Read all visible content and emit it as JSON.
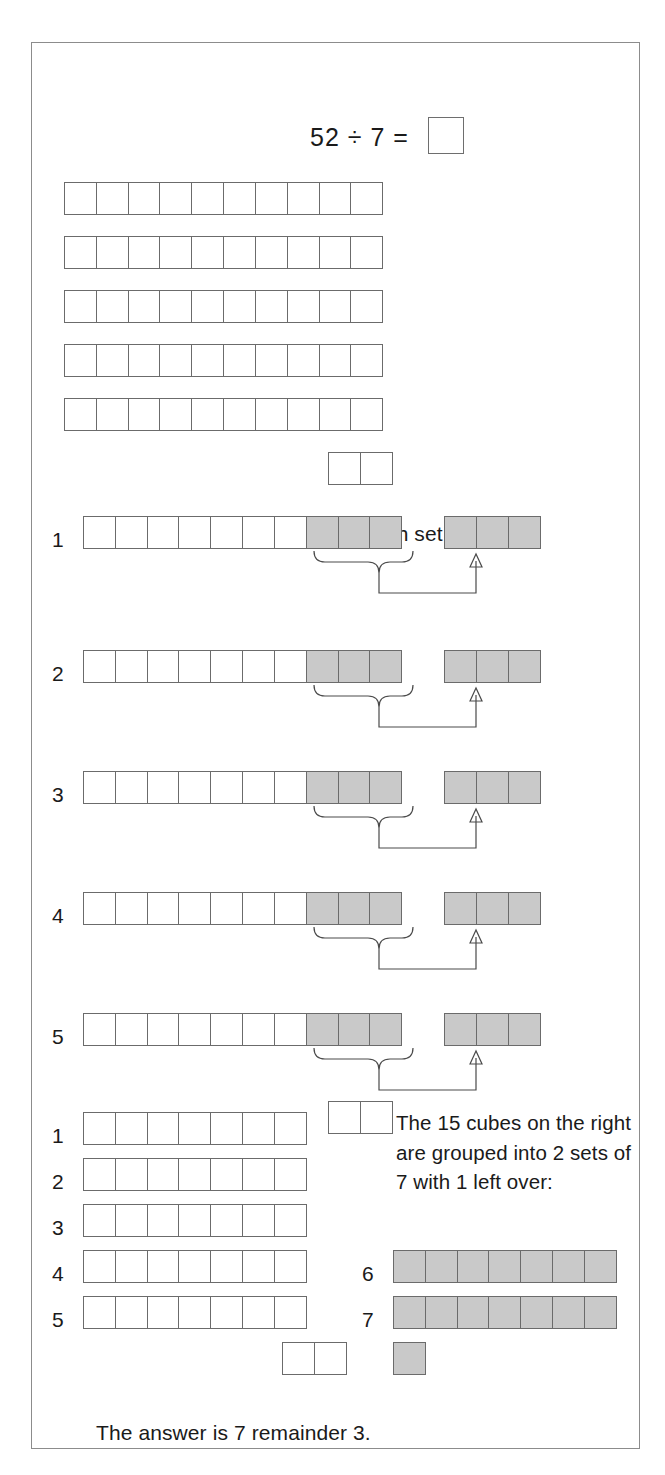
{
  "page": {
    "background_color": "#ffffff",
    "frame_color": "#8c8c8c",
    "cube_outline_color": "#6b6b6b",
    "cube_fill_white": "#ffffff",
    "cube_fill_gray": "#c9c9c9"
  },
  "equation": {
    "text": "52 ÷ 7 =",
    "dividend": 52,
    "divisor": 7,
    "answer_box_value": ""
  },
  "sections": {
    "first": {
      "caption": "52 cubes:",
      "total_cubes": 52,
      "rows": [
        {
          "cells": 10,
          "fill": "white"
        },
        {
          "cells": 10,
          "fill": "white"
        },
        {
          "cells": 10,
          "fill": "white"
        },
        {
          "cells": 10,
          "fill": "white"
        },
        {
          "cells": 10,
          "fill": "white"
        },
        {
          "cells": 2,
          "fill": "white"
        }
      ]
    },
    "second": {
      "caption": "Three cubes are taken from each set of 10:",
      "rows": [
        {
          "number": "1",
          "white_cells": 7,
          "gray_cells": 3,
          "moved_group_cells": 3
        },
        {
          "number": "2",
          "white_cells": 7,
          "gray_cells": 3,
          "moved_group_cells": 3
        },
        {
          "number": "3",
          "white_cells": 7,
          "gray_cells": 3,
          "moved_group_cells": 3
        },
        {
          "number": "4",
          "white_cells": 7,
          "gray_cells": 3,
          "moved_group_cells": 3
        },
        {
          "number": "5",
          "white_cells": 7,
          "gray_cells": 3,
          "moved_group_cells": 3
        }
      ],
      "remainder_row": {
        "cells": 2,
        "fill": "white"
      }
    },
    "third": {
      "caption": "The 15 cubes on the right are grouped into 2 sets of 7 with 1 left over:",
      "left_rows": [
        {
          "number": "1",
          "cells": 7,
          "fill": "white"
        },
        {
          "number": "2",
          "cells": 7,
          "fill": "white"
        },
        {
          "number": "3",
          "cells": 7,
          "fill": "white"
        },
        {
          "number": "4",
          "cells": 7,
          "fill": "white"
        },
        {
          "number": "5",
          "cells": 7,
          "fill": "white"
        }
      ],
      "left_leftover": {
        "cells": 2,
        "fill": "white"
      },
      "right_rows": [
        {
          "number": "6",
          "cells": 7,
          "fill": "gray"
        },
        {
          "number": "7",
          "cells": 7,
          "fill": "gray"
        }
      ],
      "right_leftover": {
        "cells": 1,
        "fill": "gray"
      }
    },
    "conclusion": {
      "text": "The answer is 7 remainder 3."
    }
  }
}
